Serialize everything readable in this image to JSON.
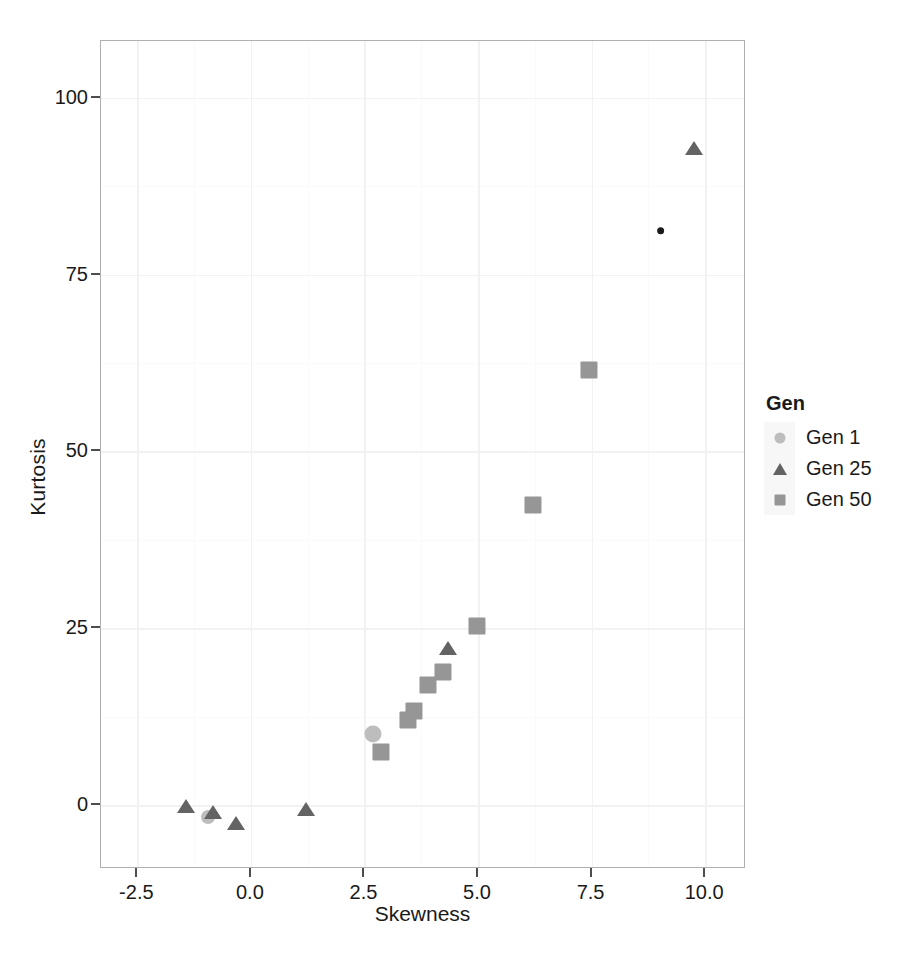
{
  "chart_data": {
    "type": "scatter",
    "title": "",
    "xlabel": "Skewness",
    "ylabel": "Kurtosis",
    "xlim": [
      -3.3,
      10.9
    ],
    "ylim": [
      -9,
      108
    ],
    "xticks": [
      "-2.5",
      "0.0",
      "2.5",
      "5.0",
      "7.5",
      "10.0"
    ],
    "xtick_values": [
      -2.5,
      0.0,
      2.5,
      5.0,
      7.5,
      10.0
    ],
    "yticks": [
      "0",
      "25",
      "50",
      "75",
      "100"
    ],
    "ytick_values": [
      0,
      25,
      50,
      75,
      100
    ],
    "grid": true,
    "legend": {
      "title": "Gen",
      "position": "right",
      "entries": [
        {
          "label": "Gen 1",
          "marker": "circle",
          "color": "#bdbdbd"
        },
        {
          "label": "Gen 25",
          "marker": "triangle",
          "color": "#636363"
        },
        {
          "label": "Gen 50",
          "marker": "square",
          "color": "#969696"
        }
      ]
    },
    "series": [
      {
        "name": "Gen 1",
        "marker": "circle",
        "color": "#bdbdbd",
        "points": [
          {
            "x": -0.95,
            "y": -1.6,
            "size": 9
          },
          {
            "x": 2.68,
            "y": 10.1,
            "size": 11
          },
          {
            "x": 9.02,
            "y": 81.2,
            "size": 5,
            "color": "#1a1a1a"
          }
        ]
      },
      {
        "name": "Gen 25",
        "marker": "triangle",
        "color": "#636363",
        "points": [
          {
            "x": -1.42,
            "y": 0.2,
            "size": 9
          },
          {
            "x": -0.83,
            "y": -0.6,
            "size": 9
          },
          {
            "x": -0.33,
            "y": -2.1,
            "size": 9
          },
          {
            "x": 1.22,
            "y": -0.2,
            "size": 9
          },
          {
            "x": 4.33,
            "y": 22.6,
            "size": 9
          },
          {
            "x": 9.76,
            "y": 93.2,
            "size": 9
          }
        ]
      },
      {
        "name": "Gen 50",
        "marker": "square",
        "color": "#969696",
        "points": [
          {
            "x": 2.86,
            "y": 7.5,
            "size": 11
          },
          {
            "x": 3.45,
            "y": 12.0,
            "size": 11
          },
          {
            "x": 3.58,
            "y": 13.3,
            "size": 11
          },
          {
            "x": 3.9,
            "y": 17.0,
            "size": 11
          },
          {
            "x": 4.22,
            "y": 18.8,
            "size": 11
          },
          {
            "x": 4.98,
            "y": 25.3,
            "size": 11
          },
          {
            "x": 6.22,
            "y": 42.4,
            "size": 11
          },
          {
            "x": 7.45,
            "y": 61.5,
            "size": 11
          }
        ]
      }
    ]
  },
  "panel": {
    "background": "#ffffff",
    "border_color": "#b0b0b0",
    "grid_major_color": "#f2f2f2",
    "grid_minor_color": "#fafafa"
  }
}
